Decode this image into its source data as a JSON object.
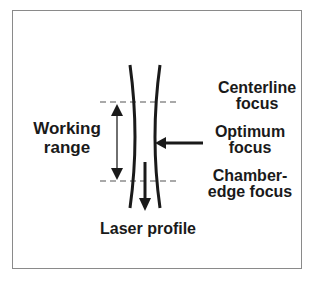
{
  "figure": {
    "labels": {
      "centerline_focus": "Centerline\nfocus",
      "optimum_focus": "Optimum\nfocus",
      "chamber_edge_focus": "Chamber-\nedge focus",
      "working_range": "Working\nrange",
      "laser_profile": "Laser profile"
    },
    "colors": {
      "line": "#1a1a1a",
      "dashed": "#555555",
      "frame": "#8a8a8a",
      "background": "#ffffff"
    }
  }
}
